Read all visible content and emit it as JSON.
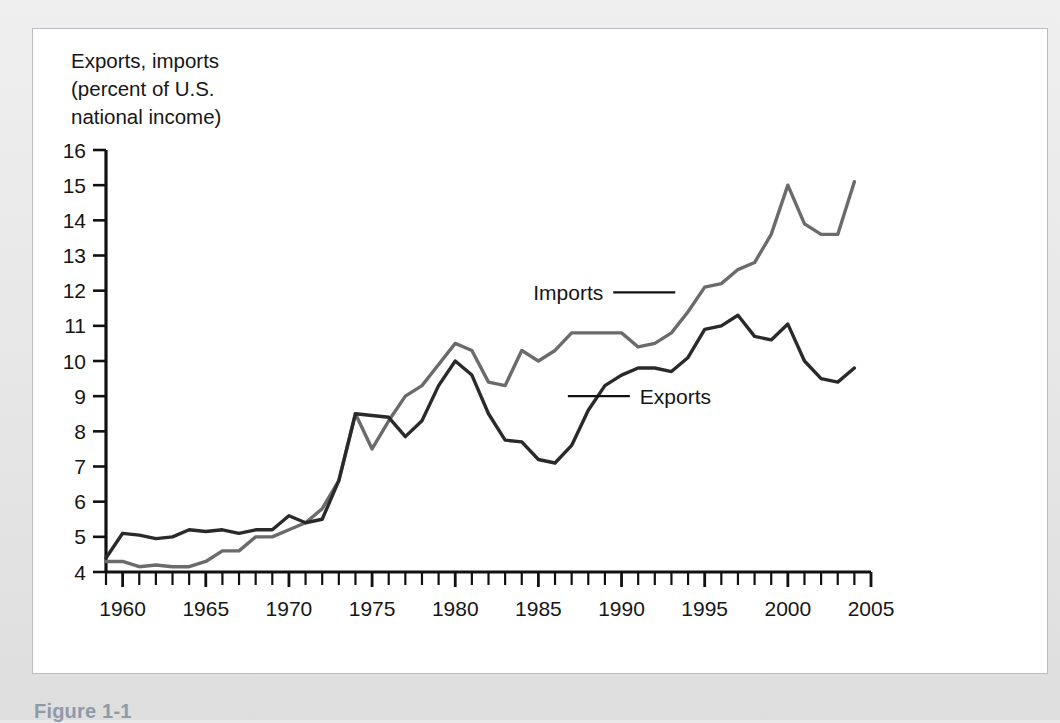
{
  "figure": {
    "caption": "Figure 1-1"
  },
  "chart_data": {
    "type": "line",
    "title": "",
    "ylabel": "Exports, imports\n(percent of U.S.\nnational income)",
    "xlabel": "",
    "ylim": [
      4,
      16
    ],
    "xlim": [
      1959,
      2005
    ],
    "y_ticks": [
      4,
      5,
      6,
      7,
      8,
      9,
      10,
      11,
      12,
      13,
      14,
      15,
      16
    ],
    "x_ticks_labeled": [
      1960,
      1965,
      1970,
      1975,
      1980,
      1985,
      1990,
      1995,
      2000,
      2005
    ],
    "x_tick_step_minor": 1,
    "grid": false,
    "legend_position": "inline-annotation",
    "annotations": [
      {
        "text": "Imports",
        "series": "Imports",
        "x": 1989.5,
        "y": 11.95
      },
      {
        "text": "Exports",
        "series": "Exports",
        "x": 1990.5,
        "y": 9.0
      }
    ],
    "x": [
      1959,
      1960,
      1961,
      1962,
      1963,
      1964,
      1965,
      1966,
      1967,
      1968,
      1969,
      1970,
      1971,
      1972,
      1973,
      1974,
      1975,
      1976,
      1977,
      1978,
      1979,
      1980,
      1981,
      1982,
      1983,
      1984,
      1985,
      1986,
      1987,
      1988,
      1989,
      1990,
      1991,
      1992,
      1993,
      1994,
      1995,
      1996,
      1997,
      1998,
      1999,
      2000,
      2001,
      2002,
      2003,
      2004
    ],
    "series": [
      {
        "name": "Imports",
        "color": "#6b6b6b",
        "values": [
          4.3,
          4.3,
          4.15,
          4.2,
          4.15,
          4.15,
          4.3,
          4.6,
          4.6,
          5.0,
          5.0,
          5.2,
          5.4,
          5.8,
          6.6,
          8.5,
          7.5,
          8.3,
          9.0,
          9.3,
          9.9,
          10.5,
          10.3,
          9.4,
          9.3,
          10.3,
          10.0,
          10.3,
          10.8,
          10.8,
          10.8,
          10.8,
          10.4,
          10.5,
          10.8,
          11.4,
          12.1,
          12.2,
          12.6,
          12.8,
          13.6,
          15.0,
          13.9,
          13.6,
          13.6,
          15.1
        ]
      },
      {
        "name": "Exports",
        "color": "#2a2a2a",
        "values": [
          4.4,
          5.1,
          5.05,
          4.95,
          5.0,
          5.2,
          5.15,
          5.2,
          5.1,
          5.2,
          5.2,
          5.6,
          5.4,
          5.5,
          6.6,
          8.5,
          8.45,
          8.4,
          7.85,
          8.3,
          9.3,
          10.0,
          9.6,
          8.5,
          7.75,
          7.7,
          7.2,
          7.1,
          7.6,
          8.6,
          9.3,
          9.6,
          9.8,
          9.8,
          9.7,
          10.1,
          10.9,
          11.0,
          11.3,
          10.7,
          10.6,
          11.05,
          10.0,
          9.5,
          9.4,
          9.8
        ]
      }
    ]
  }
}
